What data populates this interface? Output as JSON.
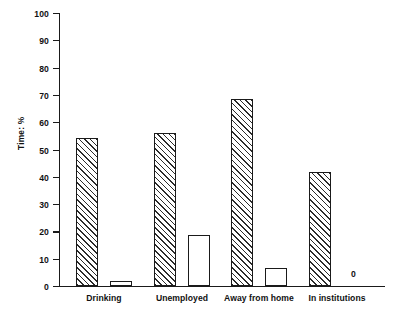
{
  "chart_data": {
    "type": "bar",
    "title": "",
    "subtitle": "",
    "xlabel": "",
    "ylabel": "Time: %",
    "ylim": [
      0,
      100
    ],
    "ytick_step": 10,
    "yticks": [
      0,
      10,
      20,
      30,
      40,
      50,
      60,
      70,
      80,
      90,
      100
    ],
    "ytick_labels": [
      "0",
      "10",
      "20",
      "30",
      "40",
      "50",
      "60",
      "70",
      "80",
      "90",
      "100"
    ],
    "grid": false,
    "legend": "none",
    "categories": [
      "Drinking",
      "Unemployed",
      "Away from home",
      "In institutions"
    ],
    "series": [
      {
        "name": "series-1",
        "style": "hatched",
        "values": [
          54.5,
          56,
          68.5,
          42
        ]
      },
      {
        "name": "series-2",
        "style": "open",
        "values": [
          2,
          18.7,
          6.8,
          0
        ]
      }
    ],
    "annotations": [
      {
        "text": "0",
        "category": "In institutions",
        "series": "series-2",
        "value": 0
      }
    ]
  }
}
